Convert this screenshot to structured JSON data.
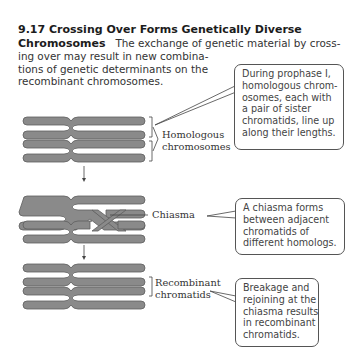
{
  "figure": {
    "number": "9.17",
    "title_line1": "9.17  Crossing Over Forms Genetically Diverse",
    "title_line2": "Chromosomes",
    "caption_lines": [
      "The exchange of genetic material by cross-",
      "ing over may result in new combina-",
      "tions of genetic determinants on the",
      "recombinant chromosomes."
    ]
  },
  "labels": {
    "homologous": [
      "Homologous",
      "chromosomes"
    ],
    "chiasma": "Chiasma",
    "recombinant": [
      "Recombinant",
      "chromatids"
    ]
  },
  "callouts": {
    "prophase": [
      "During prophase I,",
      "homologous chrom-",
      "osomes, each with",
      "a pair of sister",
      "chromatids, line up",
      "along their lengths."
    ],
    "chiasma": [
      "A chiasma forms",
      "between adjacent",
      "chromatids of",
      "different homologs."
    ],
    "breakage": [
      "Breakage and",
      "rejoining at the",
      "chiasma results",
      "in recombinant",
      "chromatids."
    ]
  },
  "colors": {
    "chromatid_fill": "#8a8a8a",
    "chromatid_stroke": "#5e5e5e",
    "line": "#444444"
  }
}
